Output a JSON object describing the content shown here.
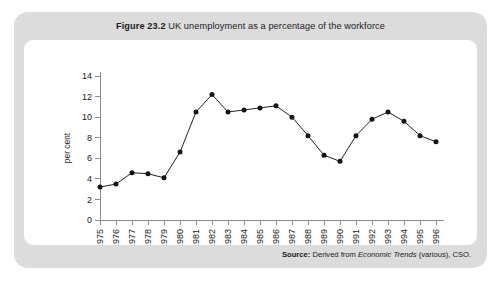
{
  "figure": {
    "label": "Figure 23.2",
    "caption": "UK unemployment as a percentage of the workforce"
  },
  "source": {
    "label": "Source:",
    "text_before": "Derived from",
    "italic_text": "Economic Trends",
    "text_after": "(various), CSO."
  },
  "colors": {
    "panel_background": "#dcdcdc",
    "plot_background": "#ffffff",
    "axis": "#8d8d8d",
    "line": "#222222",
    "marker": "#141414",
    "text": "#1b1b1b"
  },
  "chart_data": {
    "type": "line",
    "title": "Figure 23.2 UK unemployment as a percentage of the workforce",
    "xlabel": "",
    "ylabel": "per cent",
    "ylim": [
      0,
      14
    ],
    "yticks": [
      0,
      2,
      4,
      6,
      8,
      10,
      12,
      14
    ],
    "grid": false,
    "legend": null,
    "marker": "circle",
    "categories": [
      "1975",
      "1976",
      "1977",
      "1978",
      "1979",
      "1980",
      "1981",
      "1982",
      "1983",
      "1984",
      "1985",
      "1986",
      "1987",
      "1988",
      "1989",
      "1990",
      "1991",
      "1992",
      "1993",
      "1994",
      "1995",
      "1996"
    ],
    "values": [
      3.2,
      3.5,
      4.6,
      4.5,
      4.1,
      6.6,
      10.5,
      12.2,
      10.5,
      10.7,
      10.9,
      11.1,
      10.0,
      8.2,
      6.3,
      5.7,
      8.2,
      9.8,
      10.5,
      9.6,
      8.2,
      7.6
    ]
  }
}
